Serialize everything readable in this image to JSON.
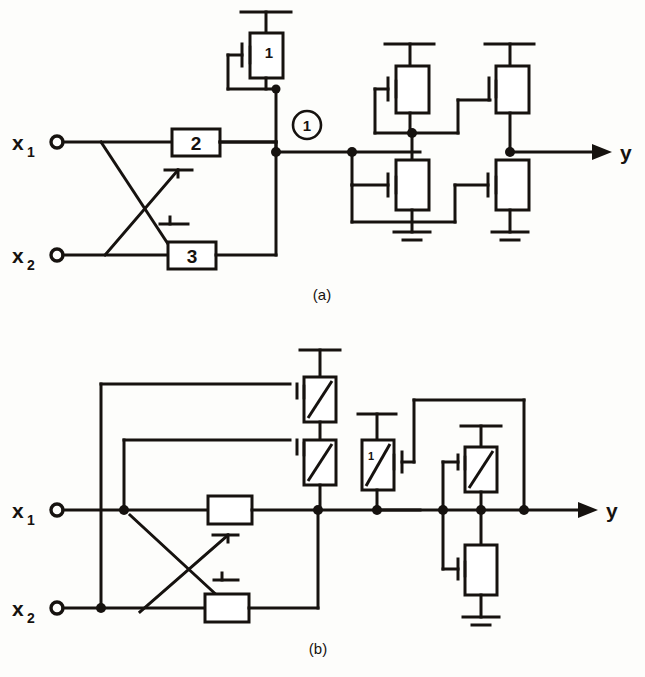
{
  "figure": {
    "title_visible": false,
    "panels": [
      {
        "id": "a",
        "caption": "(a)",
        "inputs": [
          {
            "name": "x1",
            "label": "x",
            "subscript": "1"
          },
          {
            "name": "x2",
            "label": "x",
            "subscript": "2"
          }
        ],
        "output": {
          "name": "y",
          "label": "y"
        },
        "node_markers": [
          {
            "label": "1",
            "shape": "circle"
          }
        ],
        "blocks": [
          {
            "name": "block-2",
            "label": "2"
          },
          {
            "name": "block-3",
            "label": "3"
          }
        ],
        "transistors": [
          {
            "name": "load-transistor-1",
            "label": "1",
            "type": "enhancement-load",
            "gate_side": "left"
          },
          {
            "name": "inverter1-load",
            "label": "",
            "type": "enhancement-load",
            "gate_side": "left"
          },
          {
            "name": "inverter1-driver",
            "label": "",
            "type": "enhancement-driver",
            "gate_side": "left"
          },
          {
            "name": "inverter2-load",
            "label": "",
            "type": "enhancement-load",
            "gate_side": "left"
          },
          {
            "name": "inverter2-driver",
            "label": "",
            "type": "enhancement-driver",
            "gate_side": "left"
          }
        ],
        "pass_gates": 2,
        "grounds": 2
      },
      {
        "id": "b",
        "caption": "(b)",
        "inputs": [
          {
            "name": "x1",
            "label": "x",
            "subscript": "1"
          },
          {
            "name": "x2",
            "label": "x",
            "subscript": "2"
          }
        ],
        "output": {
          "name": "y",
          "label": "y"
        },
        "node_markers": [],
        "blocks": [
          {
            "name": "pass-box-top",
            "label": ""
          },
          {
            "name": "pass-box-bottom",
            "label": ""
          }
        ],
        "transistors": [
          {
            "name": "depletion-top",
            "label": "",
            "type": "depletion",
            "gate_side": "left"
          },
          {
            "name": "depletion-second",
            "label": "",
            "type": "depletion",
            "gate_side": "left"
          },
          {
            "name": "depletion-labeled-1",
            "label": "1",
            "type": "depletion",
            "gate_side": "right"
          },
          {
            "name": "output-load",
            "label": "",
            "type": "depletion",
            "gate_side": "left"
          },
          {
            "name": "output-driver",
            "label": "",
            "type": "enhancement-driver",
            "gate_side": "left"
          }
        ],
        "pass_gates": 2,
        "grounds": 1
      }
    ],
    "colors": {
      "ink": "#16120f",
      "paper": "#fdfdfb",
      "device_fill": "#ffffff"
    }
  }
}
